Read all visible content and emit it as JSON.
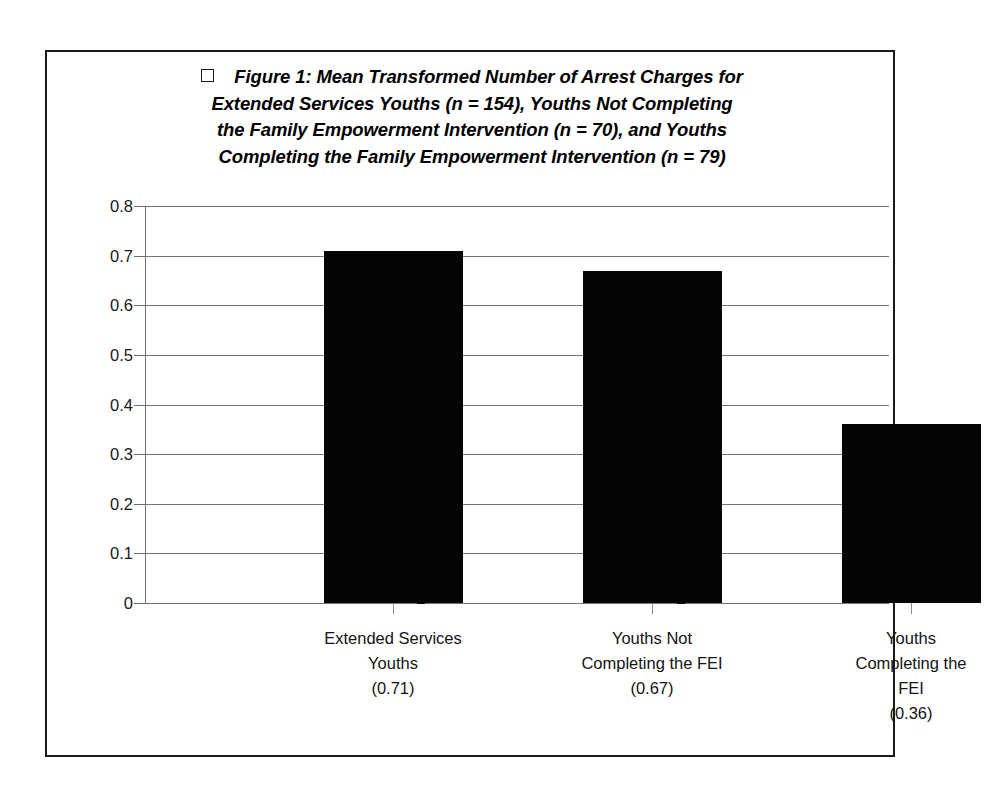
{
  "figure": {
    "legend_marker": "empty-square-marker",
    "title_lines": [
      "Figure 1: Mean Transformed Number of Arrest Charges for",
      "Extended Services Youths (n = 154), Youths Not Completing",
      "the Family Empowerment Intervention (n = 70), and Youths",
      "Completing the Family Empowerment Intervention (n = 79)"
    ],
    "frame_color": "#1a1a1a",
    "bar_color": "#050505",
    "grid_color": "#757575"
  },
  "chart_data": {
    "type": "bar",
    "xlabel": "",
    "ylabel": "",
    "ylim": [
      0,
      0.8
    ],
    "grid": true,
    "legend_position": "top",
    "yticks": [
      "0.8",
      "0.7",
      "0.6",
      "0.5",
      "0.4",
      "0.3",
      "0.2",
      "0.1",
      "0"
    ],
    "ytick_values": [
      0.8,
      0.7,
      0.6,
      0.5,
      0.4,
      0.3,
      0.2,
      0.1,
      0
    ],
    "categories": [
      "Extended Services Youths",
      "Youths Not Completing the FEI",
      "Youths Completing the FEI"
    ],
    "category_lines": [
      [
        "Extended Services",
        "Youths",
        "(0.71)"
      ],
      [
        "Youths Not",
        "Completing the FEI",
        "(0.67)"
      ],
      [
        "Youths",
        "Completing the",
        "FEI",
        "(0.36)"
      ]
    ],
    "values": [
      0.71,
      0.67,
      0.36
    ],
    "value_labels": [
      "(0.71)",
      "(0.67)",
      "(0.36)"
    ],
    "sample_sizes": [
      154,
      70,
      79
    ]
  }
}
